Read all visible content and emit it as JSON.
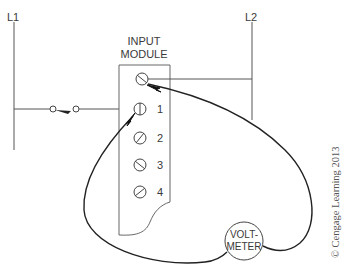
{
  "rails": {
    "left": "L1",
    "right": "L2"
  },
  "module": {
    "title_line1": "INPUT",
    "title_line2": "MODULE",
    "terminals": [
      {
        "id": "common",
        "label": ""
      },
      {
        "id": "1",
        "label": "1"
      },
      {
        "id": "2",
        "label": "2"
      },
      {
        "id": "3",
        "label": "3"
      },
      {
        "id": "4",
        "label": "4"
      }
    ]
  },
  "meter": {
    "line1": "VOLT-",
    "line2": "METER"
  },
  "copyright": "© Cengage Learning 2013",
  "colors": {
    "line": "#2a2a2a",
    "thin": "#555555",
    "text": "#3a3a3a"
  }
}
